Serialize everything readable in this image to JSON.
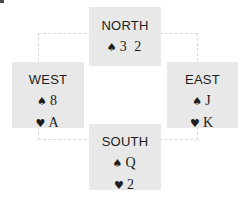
{
  "diagram": {
    "type": "bridge-hand-compass",
    "background_color": "#ffffff",
    "box_color": "#e8e8e8",
    "text_color": "#1c1c1c",
    "connector_color": "#d8d8d8",
    "spade_symbol": "♠",
    "heart_symbol": "♥",
    "hands": {
      "north": {
        "label": "NORTH",
        "suits": [
          {
            "symbol": "♠",
            "name": "spade-icon",
            "cards": "3 2"
          }
        ]
      },
      "west": {
        "label": "WEST",
        "suits": [
          {
            "symbol": "♠",
            "name": "spade-icon",
            "cards": "8"
          },
          {
            "symbol": "♥",
            "name": "heart-icon",
            "cards": "A"
          }
        ]
      },
      "east": {
        "label": "EAST",
        "suits": [
          {
            "symbol": "♠",
            "name": "spade-icon",
            "cards": "J"
          },
          {
            "symbol": "♥",
            "name": "heart-icon",
            "cards": "K"
          }
        ]
      },
      "south": {
        "label": "SOUTH",
        "suits": [
          {
            "symbol": "♠",
            "name": "spade-icon",
            "cards": "Q"
          },
          {
            "symbol": "♥",
            "name": "heart-icon",
            "cards": "2"
          }
        ]
      }
    }
  }
}
